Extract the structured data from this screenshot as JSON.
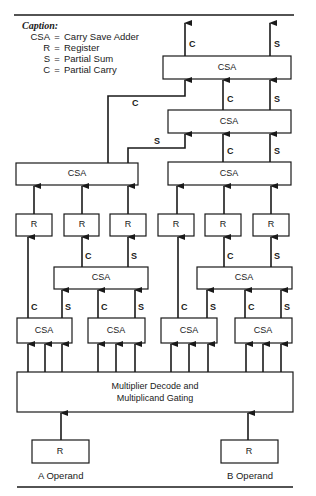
{
  "caption": {
    "title": "Caption:",
    "legend": [
      {
        "key": "CSA",
        "eq": "=",
        "meaning": "Carry Save Adder"
      },
      {
        "key": "R",
        "eq": "=",
        "meaning": "Register"
      },
      {
        "key": "S",
        "eq": "=",
        "meaning": "Partial Sum"
      },
      {
        "key": "C",
        "eq": "=",
        "meaning": "Partial Carry"
      }
    ]
  },
  "boxes": {
    "csa_top": "CSA",
    "csa_second": "CSA",
    "csa_left_upper": "CSA",
    "csa_right_upper": "CSA",
    "reg_1": "R",
    "reg_2": "R",
    "reg_3": "R",
    "reg_4": "R",
    "reg_5": "R",
    "reg_6": "R",
    "csa_mid_left": "CSA",
    "csa_mid_right": "CSA",
    "csa_bot_1": "CSA",
    "csa_bot_2": "CSA",
    "csa_bot_3": "CSA",
    "csa_bot_4": "CSA",
    "decode_line1": "Multiplier Decode and",
    "decode_line2": "Multiplicand Gating",
    "reg_a": "R",
    "reg_b": "R"
  },
  "wire_labels": {
    "out_c": "C",
    "out_s": "S",
    "c2_to_top": "C",
    "s2_to_top": "S",
    "left_c_long": "C",
    "left_s": "S",
    "ru_c": "C",
    "ru_s": "S",
    "r2_c": "C",
    "r3_s": "S",
    "r5_c": "C",
    "r6_s": "S",
    "bl1_c": "C",
    "bl1_s": "S",
    "bl2_c": "C",
    "bl2_s": "S",
    "br1_c": "C",
    "br1_s": "S",
    "br2_c": "C",
    "br2_s": "S"
  },
  "operands": {
    "a_label": "A Operand",
    "b_label": "B Operand"
  }
}
